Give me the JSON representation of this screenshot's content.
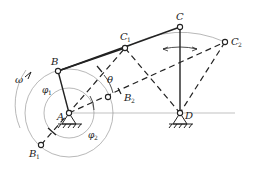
{
  "diagram": {
    "colors": {
      "line": "#222222",
      "thin": "#999999",
      "bg": "#ffffff"
    },
    "labels": {
      "A": "A",
      "B": "B",
      "B1": "B",
      "B1_sub": "1",
      "B2": "B",
      "B2_sub": "2",
      "C": "C",
      "C1": "C",
      "C1_sub": "1",
      "C2": "C",
      "C2_sub": "2",
      "D": "D",
      "theta": "θ",
      "omega": "ω",
      "phi1": "φ",
      "phi1_sub": "1",
      "phi2": "φ",
      "phi2_sub": "2"
    },
    "points": {
      "A": [
        69,
        113
      ],
      "D": [
        180,
        113
      ],
      "B": [
        58,
        71
      ],
      "C": [
        180,
        27
      ],
      "C1": [
        125,
        48
      ],
      "C2": [
        225,
        42
      ],
      "B1": [
        41,
        145
      ],
      "B2": [
        108,
        97
      ]
    }
  }
}
